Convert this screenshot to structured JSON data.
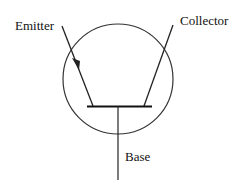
{
  "diagram": {
    "labels": {
      "emitter": "Emitter",
      "collector": "Collector",
      "base": "Base"
    },
    "colors": {
      "stroke": "#222222",
      "background": "#ffffff"
    }
  }
}
